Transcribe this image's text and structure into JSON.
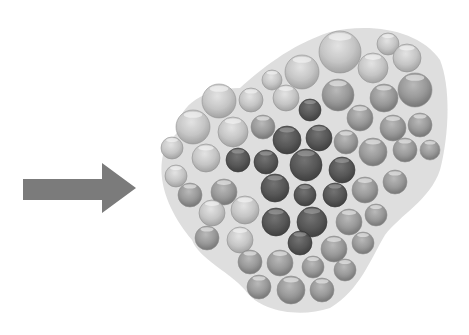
{
  "figure": {
    "arrow": {
      "icon": "right-arrow-icon",
      "color": "#7b7b7b",
      "shaft": {
        "x": 23,
        "y": 179,
        "width": 79,
        "height": 21
      },
      "head": {
        "base_x": 102,
        "top_y": 163,
        "bottom_y": 213,
        "tip_x": 136,
        "tip_y": 188
      }
    },
    "cluster": {
      "icon": "sphere-cluster-icon",
      "light_color": "#c9c9c9",
      "mid_color": "#9a9a9a",
      "dark_color": "#4a4a4a",
      "bounds": {
        "x": 155,
        "y": 28,
        "width": 290,
        "height": 285
      },
      "spheres": [
        {
          "cx": 340,
          "cy": 52,
          "r": 21,
          "tone": "light"
        },
        {
          "cx": 388,
          "cy": 44,
          "r": 11,
          "tone": "light"
        },
        {
          "cx": 407,
          "cy": 58,
          "r": 14,
          "tone": "light"
        },
        {
          "cx": 302,
          "cy": 72,
          "r": 17,
          "tone": "light"
        },
        {
          "cx": 373,
          "cy": 68,
          "r": 15,
          "tone": "light"
        },
        {
          "cx": 272,
          "cy": 80,
          "r": 10,
          "tone": "light"
        },
        {
          "cx": 415,
          "cy": 90,
          "r": 17,
          "tone": "mid"
        },
        {
          "cx": 384,
          "cy": 98,
          "r": 14,
          "tone": "mid"
        },
        {
          "cx": 338,
          "cy": 95,
          "r": 16,
          "tone": "mid"
        },
        {
          "cx": 219,
          "cy": 101,
          "r": 17,
          "tone": "light"
        },
        {
          "cx": 251,
          "cy": 100,
          "r": 12,
          "tone": "light"
        },
        {
          "cx": 286,
          "cy": 98,
          "r": 13,
          "tone": "light"
        },
        {
          "cx": 310,
          "cy": 110,
          "r": 11,
          "tone": "dark"
        },
        {
          "cx": 360,
          "cy": 118,
          "r": 13,
          "tone": "mid"
        },
        {
          "cx": 193,
          "cy": 127,
          "r": 17,
          "tone": "light"
        },
        {
          "cx": 233,
          "cy": 132,
          "r": 15,
          "tone": "light"
        },
        {
          "cx": 263,
          "cy": 127,
          "r": 12,
          "tone": "mid"
        },
        {
          "cx": 393,
          "cy": 128,
          "r": 13,
          "tone": "mid"
        },
        {
          "cx": 420,
          "cy": 125,
          "r": 12,
          "tone": "mid"
        },
        {
          "cx": 287,
          "cy": 140,
          "r": 14,
          "tone": "dark"
        },
        {
          "cx": 319,
          "cy": 138,
          "r": 13,
          "tone": "dark"
        },
        {
          "cx": 346,
          "cy": 142,
          "r": 12,
          "tone": "mid"
        },
        {
          "cx": 373,
          "cy": 152,
          "r": 14,
          "tone": "mid"
        },
        {
          "cx": 405,
          "cy": 150,
          "r": 12,
          "tone": "mid"
        },
        {
          "cx": 430,
          "cy": 150,
          "r": 10,
          "tone": "mid"
        },
        {
          "cx": 172,
          "cy": 148,
          "r": 11,
          "tone": "light"
        },
        {
          "cx": 206,
          "cy": 158,
          "r": 14,
          "tone": "light"
        },
        {
          "cx": 238,
          "cy": 160,
          "r": 12,
          "tone": "dark"
        },
        {
          "cx": 266,
          "cy": 162,
          "r": 12,
          "tone": "dark"
        },
        {
          "cx": 306,
          "cy": 165,
          "r": 16,
          "tone": "dark"
        },
        {
          "cx": 342,
          "cy": 170,
          "r": 13,
          "tone": "dark"
        },
        {
          "cx": 176,
          "cy": 176,
          "r": 11,
          "tone": "light"
        },
        {
          "cx": 190,
          "cy": 195,
          "r": 12,
          "tone": "mid"
        },
        {
          "cx": 224,
          "cy": 192,
          "r": 13,
          "tone": "mid"
        },
        {
          "cx": 275,
          "cy": 188,
          "r": 14,
          "tone": "dark"
        },
        {
          "cx": 305,
          "cy": 195,
          "r": 11,
          "tone": "dark"
        },
        {
          "cx": 335,
          "cy": 195,
          "r": 12,
          "tone": "dark"
        },
        {
          "cx": 365,
          "cy": 190,
          "r": 13,
          "tone": "mid"
        },
        {
          "cx": 395,
          "cy": 182,
          "r": 12,
          "tone": "mid"
        },
        {
          "cx": 212,
          "cy": 213,
          "r": 13,
          "tone": "light"
        },
        {
          "cx": 245,
          "cy": 210,
          "r": 14,
          "tone": "light"
        },
        {
          "cx": 276,
          "cy": 222,
          "r": 14,
          "tone": "dark"
        },
        {
          "cx": 312,
          "cy": 222,
          "r": 15,
          "tone": "dark"
        },
        {
          "cx": 349,
          "cy": 222,
          "r": 13,
          "tone": "mid"
        },
        {
          "cx": 376,
          "cy": 215,
          "r": 11,
          "tone": "mid"
        },
        {
          "cx": 207,
          "cy": 238,
          "r": 12,
          "tone": "mid"
        },
        {
          "cx": 240,
          "cy": 240,
          "r": 13,
          "tone": "light"
        },
        {
          "cx": 300,
          "cy": 243,
          "r": 12,
          "tone": "dark"
        },
        {
          "cx": 334,
          "cy": 249,
          "r": 13,
          "tone": "mid"
        },
        {
          "cx": 363,
          "cy": 243,
          "r": 11,
          "tone": "mid"
        },
        {
          "cx": 250,
          "cy": 262,
          "r": 12,
          "tone": "mid"
        },
        {
          "cx": 280,
          "cy": 263,
          "r": 13,
          "tone": "mid"
        },
        {
          "cx": 313,
          "cy": 267,
          "r": 11,
          "tone": "mid"
        },
        {
          "cx": 345,
          "cy": 270,
          "r": 11,
          "tone": "mid"
        },
        {
          "cx": 259,
          "cy": 287,
          "r": 12,
          "tone": "mid"
        },
        {
          "cx": 291,
          "cy": 290,
          "r": 14,
          "tone": "mid"
        },
        {
          "cx": 322,
          "cy": 290,
          "r": 12,
          "tone": "mid"
        }
      ]
    }
  }
}
